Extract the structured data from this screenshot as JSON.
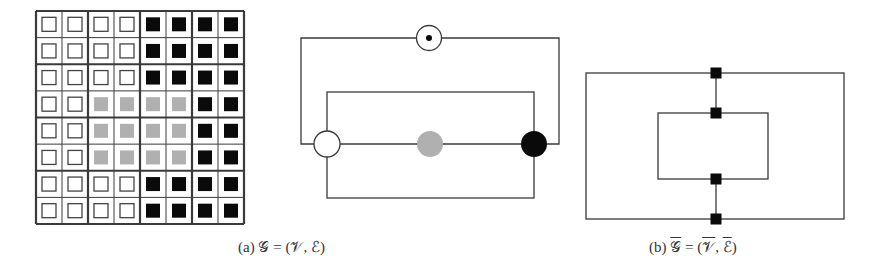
{
  "figure": {
    "panels": [
      {
        "id": "a",
        "caption": {
          "label": "(a)",
          "graph": "𝒢",
          "eq": "=",
          "open": "(",
          "vertices": "𝒱",
          "comma": ",",
          "edges": "ℰ",
          "close": ")"
        }
      },
      {
        "id": "b",
        "caption": {
          "label": "(b)",
          "graph": "𝒢",
          "eq": "=",
          "open": "(",
          "vertices": "𝒱",
          "comma": ",",
          "edges": "ℰ",
          "close": ")"
        }
      }
    ],
    "grid": {
      "rows": 8,
      "cols": 8,
      "block_size": 2,
      "pattern": [
        [
          "W",
          "W",
          "W",
          "W",
          "B",
          "B",
          "B",
          "B"
        ],
        [
          "W",
          "W",
          "W",
          "W",
          "B",
          "B",
          "B",
          "B"
        ],
        [
          "W",
          "W",
          "W",
          "W",
          "B",
          "B",
          "B",
          "B"
        ],
        [
          "W",
          "W",
          "G",
          "G",
          "G",
          "G",
          "B",
          "B"
        ],
        [
          "W",
          "W",
          "G",
          "G",
          "G",
          "G",
          "B",
          "B"
        ],
        [
          "W",
          "W",
          "G",
          "G",
          "G",
          "G",
          "B",
          "B"
        ],
        [
          "W",
          "W",
          "W",
          "W",
          "B",
          "B",
          "B",
          "B"
        ],
        [
          "W",
          "W",
          "W",
          "W",
          "B",
          "B",
          "B",
          "B"
        ]
      ]
    },
    "colors": {
      "line": "#3a3a3a",
      "black": "#0a0a0a",
      "gray": "#b0b0b0",
      "white": "#ffffff"
    },
    "graph_a": {
      "nodes": [
        {
          "name": "white-node",
          "x": 327,
          "y": 144,
          "fill": "white"
        },
        {
          "name": "gray-node",
          "x": 430,
          "y": 144,
          "fill": "gray"
        },
        {
          "name": "black-node",
          "x": 534,
          "y": 144,
          "fill": "black"
        },
        {
          "name": "dotted-node",
          "x": 429,
          "y": 38,
          "fill": "white-dot"
        }
      ]
    },
    "graph_b": {
      "nodes": [
        {
          "x": 716,
          "y": 73
        },
        {
          "x": 716,
          "y": 113
        },
        {
          "x": 716,
          "y": 179
        },
        {
          "x": 716,
          "y": 219
        }
      ]
    }
  }
}
